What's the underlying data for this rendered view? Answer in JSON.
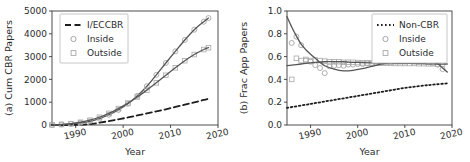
{
  "figure": {
    "width": 470,
    "height": 162,
    "background": "#ffffff"
  },
  "colors": {
    "axis": "#3a3a3a",
    "text": "#2b2b2b",
    "curve": "#555555",
    "marker_inside": "#9a9a9a",
    "marker_outside": "#a8a8a8",
    "dashed": "#1e1e1e",
    "dotted": "#1e1e1e",
    "legend_border": "#b8b8b8"
  },
  "chart_data": [
    {
      "id": "panel-a",
      "type": "line",
      "title": "",
      "xlabel": "Year",
      "ylabel": "(a) Cum CBR Papers",
      "xlim": [
        1985,
        2020
      ],
      "ylim": [
        0,
        5000
      ],
      "xticks": [
        1990,
        2000,
        2010,
        2020
      ],
      "xticklabels": [
        "1990",
        "2000",
        "2010",
        "2020"
      ],
      "yticks": [
        0,
        1000,
        2000,
        3000,
        4000,
        5000
      ],
      "yticklabels": [
        "0",
        "1000",
        "2000",
        "3000",
        "4000",
        "5000"
      ],
      "grid": false,
      "legend_position": "upper left",
      "legend": [
        {
          "label": "I/ECCBR",
          "style": "dashed-line",
          "color": "#1e1e1e"
        },
        {
          "label": "Inside",
          "style": "circle-marker",
          "color": "#9a9a9a"
        },
        {
          "label": "Outside",
          "style": "square-marker",
          "color": "#a8a8a8"
        }
      ],
      "series": [
        {
          "name": "I/ECCBR",
          "style": "dashed",
          "x": [
            1985,
            1988,
            1991,
            1993,
            1995,
            1997,
            1999,
            2001,
            2003,
            2005,
            2007,
            2009,
            2011,
            2013,
            2015,
            2017,
            2018
          ],
          "values": [
            0,
            0,
            10,
            40,
            100,
            170,
            250,
            330,
            420,
            510,
            600,
            690,
            790,
            890,
            990,
            1100,
            1150
          ]
        },
        {
          "name": "Inside",
          "style": "solid-with-circles",
          "x": [
            1985,
            1987,
            1989,
            1991,
            1993,
            1995,
            1997,
            1999,
            2001,
            2003,
            2005,
            2007,
            2009,
            2011,
            2013,
            2015,
            2017,
            2018
          ],
          "values": [
            5,
            20,
            45,
            90,
            160,
            280,
            450,
            660,
            930,
            1280,
            1700,
            2200,
            2720,
            3230,
            3730,
            4180,
            4530,
            4690
          ]
        },
        {
          "name": "Outside",
          "style": "solid-with-squares",
          "x": [
            1985,
            1987,
            1989,
            1991,
            1993,
            1995,
            1997,
            1999,
            2001,
            2003,
            2005,
            2007,
            2009,
            2011,
            2013,
            2015,
            2017,
            2018
          ],
          "values": [
            5,
            25,
            60,
            120,
            210,
            340,
            510,
            720,
            960,
            1230,
            1530,
            1850,
            2180,
            2510,
            2820,
            3090,
            3310,
            3390
          ]
        }
      ]
    },
    {
      "id": "panel-b",
      "type": "line",
      "title": "",
      "xlabel": "Year",
      "ylabel": "(b) Frac App Papers",
      "xlim": [
        1985,
        2020
      ],
      "ylim": [
        0.0,
        1.0
      ],
      "xticks": [
        1990,
        2000,
        2010,
        2020
      ],
      "xticklabels": [
        "1990",
        "2000",
        "2010",
        "2020"
      ],
      "yticks": [
        0.0,
        0.2,
        0.4,
        0.6,
        0.8,
        1.0
      ],
      "yticklabels": [
        "0.0",
        "0.2",
        "0.4",
        "0.6",
        "0.8",
        "1.0"
      ],
      "grid": false,
      "legend_position": "upper right",
      "legend": [
        {
          "label": "Non-CBR",
          "style": "dotted-line",
          "color": "#1e1e1e"
        },
        {
          "label": "Inside",
          "style": "circle-marker",
          "color": "#9a9a9a"
        },
        {
          "label": "Outside",
          "style": "square-marker",
          "color": "#a8a8a8"
        }
      ],
      "series": [
        {
          "name": "Non-CBR",
          "style": "dotted",
          "x": [
            1985,
            1990,
            1995,
            2000,
            2005,
            2010,
            2015,
            2019
          ],
          "values": [
            0.15,
            0.185,
            0.22,
            0.255,
            0.29,
            0.325,
            0.35,
            0.365
          ]
        },
        {
          "name": "Inside",
          "style": "solid-with-circles",
          "x": [
            1985,
            1986,
            1987,
            1988,
            1989,
            1990,
            1991,
            1992,
            1993,
            1995,
            1997,
            1999,
            2001,
            2003,
            2005,
            2007,
            2009,
            2011,
            2013,
            2015,
            2017,
            2018,
            2019
          ],
          "values": [
            0.95,
            0.86,
            0.78,
            0.71,
            0.66,
            0.62,
            0.585,
            0.55,
            0.52,
            0.49,
            0.475,
            0.48,
            0.495,
            0.515,
            0.535,
            0.55,
            0.565,
            0.575,
            0.575,
            0.565,
            0.535,
            0.5,
            0.465
          ]
        },
        {
          "name": "Outside",
          "style": "solid-with-squares",
          "x": [
            1985,
            1986,
            1987,
            1988,
            1989,
            1990,
            1991,
            1993,
            1995,
            1997,
            1999,
            2001,
            2003,
            2005,
            2007,
            2009,
            2011,
            2013,
            2015,
            2017,
            2019
          ],
          "values": [
            0.52,
            0.525,
            0.53,
            0.535,
            0.54,
            0.545,
            0.55,
            0.555,
            0.555,
            0.555,
            0.55,
            0.548,
            0.545,
            0.543,
            0.542,
            0.54,
            0.54,
            0.538,
            0.537,
            0.535,
            0.535
          ]
        }
      ],
      "scatter": [
        {
          "name": "Inside",
          "marker": "circle",
          "points": [
            [
              1986,
              0.72
            ],
            [
              1987,
              0.775
            ],
            [
              1988,
              0.7
            ],
            [
              1989,
              0.565
            ],
            [
              1990,
              0.555
            ],
            [
              1991,
              0.525
            ],
            [
              1992,
              0.5
            ],
            [
              1993,
              0.455
            ],
            [
              1994,
              0.515
            ],
            [
              1995,
              0.52
            ],
            [
              1996,
              0.525
            ],
            [
              1997,
              0.52
            ],
            [
              1998,
              0.53
            ],
            [
              1999,
              0.53
            ],
            [
              2000,
              0.535
            ],
            [
              2001,
              0.535
            ],
            [
              2002,
              0.54
            ],
            [
              2003,
              0.54
            ],
            [
              2004,
              0.545
            ],
            [
              2005,
              0.545
            ],
            [
              2006,
              0.55
            ],
            [
              2007,
              0.55
            ],
            [
              2008,
              0.555
            ],
            [
              2009,
              0.555
            ],
            [
              2010,
              0.555
            ],
            [
              2011,
              0.56
            ],
            [
              2012,
              0.56
            ],
            [
              2013,
              0.555
            ],
            [
              2014,
              0.555
            ],
            [
              2015,
              0.55
            ],
            [
              2016,
              0.545
            ],
            [
              2017,
              0.53
            ],
            [
              2018,
              0.49
            ]
          ]
        },
        {
          "name": "Outside",
          "marker": "square",
          "points": [
            [
              1986,
              0.4
            ],
            [
              1987,
              0.585
            ],
            [
              1988,
              0.565
            ],
            [
              1989,
              0.575
            ],
            [
              1990,
              0.565
            ],
            [
              1991,
              0.57
            ],
            [
              1992,
              0.565
            ],
            [
              1993,
              0.56
            ],
            [
              1994,
              0.555
            ],
            [
              1995,
              0.555
            ],
            [
              1996,
              0.555
            ],
            [
              1997,
              0.55
            ],
            [
              1998,
              0.55
            ],
            [
              1999,
              0.55
            ],
            [
              2000,
              0.548
            ],
            [
              2001,
              0.545
            ],
            [
              2002,
              0.545
            ],
            [
              2003,
              0.545
            ],
            [
              2004,
              0.543
            ],
            [
              2005,
              0.543
            ],
            [
              2006,
              0.542
            ],
            [
              2007,
              0.542
            ],
            [
              2008,
              0.54
            ],
            [
              2009,
              0.54
            ],
            [
              2010,
              0.54
            ],
            [
              2011,
              0.54
            ],
            [
              2012,
              0.54
            ],
            [
              2013,
              0.538
            ],
            [
              2014,
              0.538
            ],
            [
              2015,
              0.537
            ],
            [
              2016,
              0.537
            ],
            [
              2017,
              0.535
            ],
            [
              2018,
              0.535
            ]
          ]
        }
      ]
    }
  ]
}
